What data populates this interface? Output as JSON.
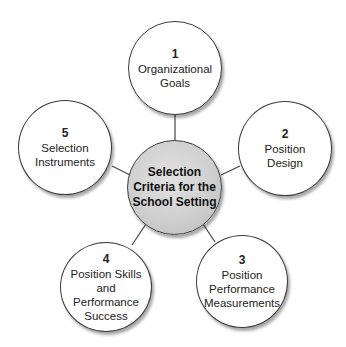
{
  "diagram": {
    "center": {
      "label": "Selection\nCriteria for the\nSchool Setting"
    },
    "nodes": [
      {
        "number": "1",
        "label": "Organizational\nGoals"
      },
      {
        "number": "2",
        "label": "Position\nDesign"
      },
      {
        "number": "3",
        "label": "Position\nPerformance\nMeasurements"
      },
      {
        "number": "4",
        "label": "Position Skills and\nPerformance\nSuccess"
      },
      {
        "number": "5",
        "label": "Selection\nInstruments"
      }
    ]
  }
}
